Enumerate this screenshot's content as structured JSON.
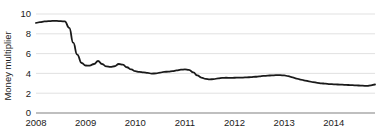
{
  "chart_data": {
    "type": "line",
    "title": "",
    "subtitle": "",
    "xlabel": "",
    "ylabel": "Money multiplier",
    "xlim": [
      2008.0,
      2014.83
    ],
    "ylim": [
      0,
      10
    ],
    "yticks": [
      0,
      2,
      4,
      6,
      8,
      10
    ],
    "ytick_labels": [
      "0",
      "2",
      "4",
      "6",
      "8",
      "10"
    ],
    "xticks": [
      2008,
      2009,
      2010,
      2011,
      2012,
      2013,
      2014
    ],
    "xtick_labels": [
      "2008",
      "2009",
      "2010",
      "2011",
      "2012",
      "2013",
      "2014"
    ],
    "grid": "horizontal",
    "grid_color": "#d9d9d9",
    "axis_color": "#808080",
    "line_color": "#1a1a1a",
    "line_width": 1.8,
    "legend": "none",
    "series": [
      {
        "name": "Money multiplier",
        "x": [
          2008.0,
          2008.08,
          2008.17,
          2008.25,
          2008.33,
          2008.42,
          2008.5,
          2008.58,
          2008.67,
          2008.75,
          2008.83,
          2008.92,
          2009.0,
          2009.08,
          2009.17,
          2009.25,
          2009.33,
          2009.42,
          2009.5,
          2009.58,
          2009.67,
          2009.75,
          2009.83,
          2009.92,
          2010.0,
          2010.08,
          2010.17,
          2010.25,
          2010.33,
          2010.42,
          2010.5,
          2010.58,
          2010.67,
          2010.75,
          2010.83,
          2010.92,
          2011.0,
          2011.08,
          2011.17,
          2011.25,
          2011.33,
          2011.42,
          2011.5,
          2011.58,
          2011.67,
          2011.75,
          2011.83,
          2011.92,
          2012.0,
          2012.08,
          2012.17,
          2012.25,
          2012.33,
          2012.42,
          2012.5,
          2012.58,
          2012.67,
          2012.75,
          2012.83,
          2012.92,
          2013.0,
          2013.08,
          2013.17,
          2013.25,
          2013.33,
          2013.42,
          2013.5,
          2013.58,
          2013.67,
          2013.75,
          2013.83,
          2013.92,
          2014.0,
          2014.08,
          2014.17,
          2014.25,
          2014.33,
          2014.42,
          2014.5,
          2014.58,
          2014.67,
          2014.75,
          2014.83
        ],
        "y": [
          9.1,
          9.18,
          9.25,
          9.28,
          9.3,
          9.3,
          9.28,
          9.25,
          8.6,
          7.1,
          5.9,
          5.05,
          4.8,
          4.78,
          4.95,
          5.25,
          4.95,
          4.7,
          4.65,
          4.72,
          4.95,
          4.88,
          4.62,
          4.4,
          4.22,
          4.15,
          4.1,
          4.05,
          3.98,
          4.0,
          4.08,
          4.15,
          4.18,
          4.22,
          4.3,
          4.38,
          4.4,
          4.35,
          4.1,
          3.8,
          3.58,
          3.45,
          3.4,
          3.42,
          3.5,
          3.55,
          3.56,
          3.55,
          3.56,
          3.58,
          3.58,
          3.6,
          3.62,
          3.66,
          3.7,
          3.74,
          3.78,
          3.8,
          3.82,
          3.82,
          3.8,
          3.72,
          3.6,
          3.48,
          3.38,
          3.28,
          3.2,
          3.12,
          3.05,
          3.0,
          2.96,
          2.92,
          2.9,
          2.88,
          2.86,
          2.84,
          2.82,
          2.8,
          2.78,
          2.76,
          2.74,
          2.8,
          2.88
        ]
      }
    ]
  },
  "axes": {
    "y_title": "Money multiplier"
  }
}
